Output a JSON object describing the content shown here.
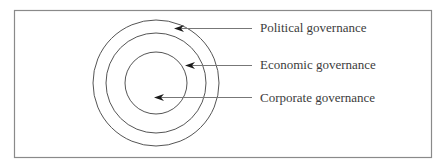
{
  "diagram": {
    "type": "concentric-circles",
    "frame": {
      "x": 14,
      "y": 10,
      "width": 417,
      "height": 147,
      "stroke": "#8a8a8a"
    },
    "center": {
      "x": 156,
      "y": 83
    },
    "stroke_color": "#555555",
    "circles": [
      {
        "name": "outer",
        "radius": 63
      },
      {
        "name": "middle",
        "radius": 50
      },
      {
        "name": "inner",
        "radius": 31
      }
    ],
    "layers": [
      {
        "label": "Political governance",
        "line_y": 28,
        "arrow_tip_x": 174,
        "line_end_x": 252,
        "label_x": 260,
        "label_y": 20
      },
      {
        "label": "Economic governance",
        "line_y": 65,
        "arrow_tip_x": 185,
        "line_end_x": 252,
        "label_x": 260,
        "label_y": 57
      },
      {
        "label": "Corporate governance",
        "line_y": 97,
        "arrow_tip_x": 154,
        "line_end_x": 252,
        "label_x": 260,
        "label_y": 90
      }
    ]
  }
}
